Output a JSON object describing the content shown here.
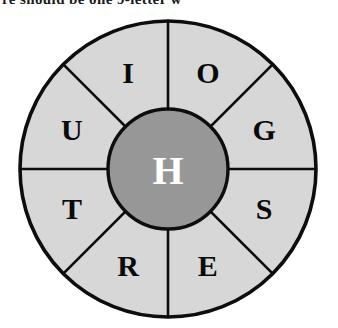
{
  "heading": {
    "clipped_text": "re should be one 9-letter w"
  },
  "puzzle": {
    "type": "word-wheel",
    "center_letter": "H",
    "outer_letters": [
      "O",
      "G",
      "S",
      "E",
      "R",
      "T",
      "U",
      "I"
    ],
    "segment_count": 8
  },
  "wheel": {
    "center_x": 157,
    "center_y": 152,
    "outer_radius": 148,
    "hub_radius": 60,
    "letter_radius": 104,
    "segments": [
      {
        "label": "O",
        "angle_deg": -67.5,
        "name": "segment-o"
      },
      {
        "label": "G",
        "angle_deg": -22.5,
        "name": "segment-g"
      },
      {
        "label": "S",
        "angle_deg": 22.5,
        "name": "segment-s"
      },
      {
        "label": "E",
        "angle_deg": 67.5,
        "name": "segment-e"
      },
      {
        "label": "R",
        "angle_deg": 112.5,
        "name": "segment-r"
      },
      {
        "label": "T",
        "angle_deg": 157.5,
        "name": "segment-t"
      },
      {
        "label": "U",
        "angle_deg": 202.5,
        "name": "segment-u"
      },
      {
        "label": "I",
        "angle_deg": 247.5,
        "name": "segment-i"
      }
    ],
    "spoke_angles_deg": [
      0,
      45,
      90,
      135,
      180,
      225,
      270,
      315
    ]
  },
  "colors": {
    "segment_fill": "#d7d7d7",
    "hub_fill": "#979797",
    "outline": "#0d0d0d",
    "outer_letter_color": "#0a0a0a",
    "center_letter_color": "#ffffff",
    "page_background": "#ffffff"
  }
}
